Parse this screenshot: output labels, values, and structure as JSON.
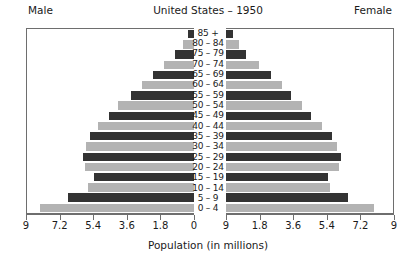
{
  "header": {
    "title": "United States – 1950",
    "male_label": "Male",
    "female_label": "Female"
  },
  "axis": {
    "xaxis_title": "Population (in millions)",
    "male_ticks": [
      "9",
      "7.2",
      "5.4",
      "3.6",
      "1.8",
      "0"
    ],
    "female_ticks": [
      "9",
      "1.8",
      "3.6",
      "5.4",
      "7.2",
      "9"
    ]
  },
  "chart_data": {
    "type": "bar",
    "title": "United States – 1950",
    "xlabel": "Population (in millions)",
    "ylabel": "",
    "xlim": [
      0,
      9
    ],
    "grid": false,
    "legend": [
      "Male",
      "Female"
    ],
    "legend_position": "top-left and top-right",
    "orientation": "horizontal-back-to-back",
    "categories": [
      "85 +",
      "80 – 84",
      "75 – 79",
      "70 – 74",
      "65 – 69",
      "60 – 64",
      "55 – 59",
      "50 – 54",
      "45 – 49",
      "40 – 44",
      "35 – 39",
      "30 – 34",
      "25 – 29",
      "20 – 24",
      "15 – 19",
      "10 – 14",
      "5 – 9",
      "0 – 4"
    ],
    "series": [
      {
        "name": "Male",
        "side": "left",
        "color": "#333333",
        "values": [
          0.3,
          0.6,
          1.0,
          1.6,
          2.2,
          2.8,
          3.4,
          4.1,
          4.6,
          5.2,
          5.6,
          5.8,
          6.0,
          5.9,
          5.4,
          5.7,
          6.8,
          8.3
        ]
      },
      {
        "name": "Female",
        "side": "right",
        "color": "#333333",
        "values": [
          0.4,
          0.7,
          1.1,
          1.8,
          2.4,
          3.0,
          3.5,
          4.1,
          4.6,
          5.2,
          5.7,
          6.0,
          6.2,
          6.1,
          5.5,
          5.6,
          6.6,
          8.0
        ]
      }
    ],
    "bar_colors_alternating": [
      "#333333",
      "#b3b3b3"
    ]
  },
  "colors": {
    "bar_dark": "#333333",
    "bar_light": "#b3b3b3",
    "frame": "#6e6e6e",
    "text": "#1a1a1a",
    "background": "#ffffff"
  }
}
